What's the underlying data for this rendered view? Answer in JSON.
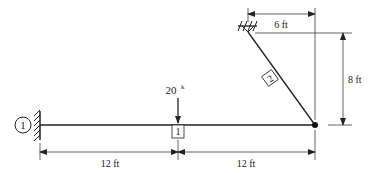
{
  "diagram": {
    "type": "structural-frame",
    "nodes": [
      {
        "id": "1",
        "label": "1",
        "support": "fixed-wall-left"
      },
      {
        "id": "top",
        "support": "pinned-ceiling"
      },
      {
        "id": "joint",
        "type": "pin-joint"
      }
    ],
    "elements": [
      {
        "id": "1",
        "label": "1",
        "type": "horizontal-beam"
      },
      {
        "id": "2",
        "label": "2",
        "type": "inclined-member"
      }
    ],
    "load": {
      "value": "20",
      "unit": "k",
      "direction": "down"
    },
    "dimensions": {
      "left_span": "12 ft",
      "right_span": "12 ft",
      "horizontal_top": "6 ft",
      "vertical_right": "8 ft"
    },
    "colors": {
      "line": "#222222",
      "background": "#ffffff"
    }
  }
}
